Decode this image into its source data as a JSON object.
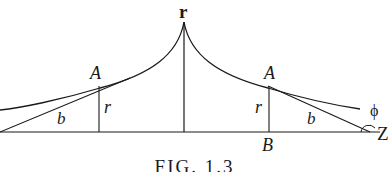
{
  "diagram": {
    "labels": {
      "apex_r": "r",
      "left_A": "A",
      "left_r": "r",
      "left_b": "b",
      "right_A": "A",
      "right_r": "r",
      "right_b": "b",
      "right_B": "B",
      "right_Z": "Z",
      "phi": "ϕ"
    },
    "caption": "FIG. 1.3",
    "colors": {
      "ink": "#1a1a1a",
      "background": "#ffffff"
    }
  }
}
